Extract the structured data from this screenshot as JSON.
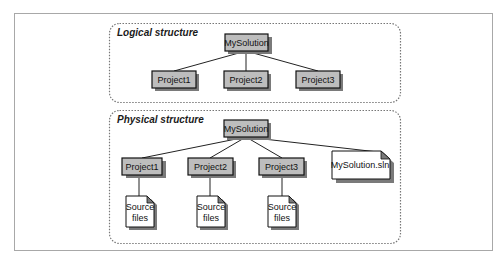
{
  "diagram": {
    "colors": {
      "node_fill": "#bdbdbd",
      "node_border": "#111111",
      "doc_fill": "#ffffff",
      "shadow": "#7a7a7a",
      "dashed_border": "#777777",
      "frame_border": "#a8a8a8"
    },
    "logical": {
      "title": "Logical structure",
      "root": "MySolution",
      "children": [
        "Project1",
        "Project2",
        "Project3"
      ]
    },
    "physical": {
      "title": "Physical structure",
      "root": "MySolution",
      "projects": [
        "Project1",
        "Project2",
        "Project3"
      ],
      "solution_file": "MySolution.sln",
      "source_doc": [
        "Source",
        "files"
      ]
    }
  }
}
